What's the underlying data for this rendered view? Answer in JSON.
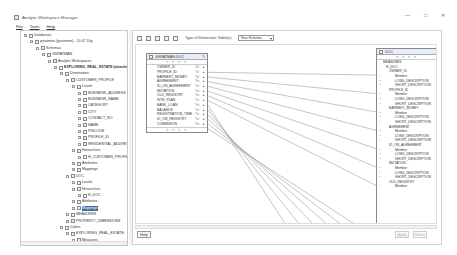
{
  "window": {
    "title": "Analytic Workspace Manager",
    "controls": {
      "minimize": "—",
      "maximize": "□",
      "close": "✕"
    }
  },
  "menu": [
    "File",
    "Tools",
    "Help"
  ],
  "tree": [
    {
      "label": "Databases",
      "indent": 0,
      "icon": "folder-icon"
    },
    {
      "label": "gsratman (gsratman) - 10.47 10g",
      "indent": 1,
      "icon": "database-icon"
    },
    {
      "label": "Schemas",
      "indent": 2,
      "icon": "folder-icon"
    },
    {
      "label": "GSRATMAN",
      "indent": 3,
      "icon": "user-icon"
    },
    {
      "label": "Analytic Workspaces",
      "indent": 4,
      "icon": "folder-icon"
    },
    {
      "label": "EXPLORING_REAL_ESTATE (attached)",
      "indent": 5,
      "icon": "workspace-icon",
      "bold": true
    },
    {
      "label": "Dimensions",
      "indent": 6,
      "icon": "folder-icon"
    },
    {
      "label": "CUSTOMER_PROFILE",
      "indent": 7,
      "icon": "dimension-icon"
    },
    {
      "label": "Levels",
      "indent": 8,
      "icon": "folder-icon"
    },
    {
      "label": "BUSINESS_ADDRESS",
      "indent": 9,
      "icon": "level-icon"
    },
    {
      "label": "BUSINESS_NAME",
      "indent": 9,
      "icon": "level-icon"
    },
    {
      "label": "CATEGORY",
      "indent": 9,
      "icon": "level-icon"
    },
    {
      "label": "CITY",
      "indent": 9,
      "icon": "level-icon"
    },
    {
      "label": "CONTACT_NO",
      "indent": 9,
      "icon": "level-icon"
    },
    {
      "label": "NAME",
      "indent": 9,
      "icon": "level-icon"
    },
    {
      "label": "PINCODE",
      "indent": 9,
      "icon": "level-icon"
    },
    {
      "label": "PROFILE_ID",
      "indent": 9,
      "icon": "level-icon"
    },
    {
      "label": "RESIDENTIAL_ADDRESS",
      "indent": 9,
      "icon": "level-icon"
    },
    {
      "label": "Hierarchies",
      "indent": 8,
      "icon": "folder-icon"
    },
    {
      "label": "H_CUSTOMER_PROFILE",
      "indent": 9,
      "icon": "hierarchy-icon"
    },
    {
      "label": "Attributes",
      "indent": 8,
      "icon": "folder-icon"
    },
    {
      "label": "Mappings",
      "indent": 8,
      "icon": "mapping-icon"
    },
    {
      "label": "DOC",
      "indent": 7,
      "icon": "dimension-icon"
    },
    {
      "label": "Levels",
      "indent": 8,
      "icon": "folder-icon"
    },
    {
      "label": "Hierarchies",
      "indent": 8,
      "icon": "folder-icon"
    },
    {
      "label": "H_DOC",
      "indent": 9,
      "icon": "hierarchy-icon"
    },
    {
      "label": "Attributes",
      "indent": 8,
      "icon": "folder-icon"
    },
    {
      "label": "Mappings",
      "indent": 8,
      "icon": "mapping-icon",
      "selected": true
    },
    {
      "label": "MEASURES",
      "indent": 7,
      "icon": "dimension-icon"
    },
    {
      "label": "PROPERTY_DIMENSIONS",
      "indent": 7,
      "icon": "dimension-icon"
    },
    {
      "label": "Cubes",
      "indent": 6,
      "icon": "folder-icon"
    },
    {
      "label": "EXPLORING_REAL_ESTATE",
      "indent": 7,
      "icon": "cube-icon"
    },
    {
      "label": "Measures",
      "indent": 8,
      "icon": "folder-icon"
    }
  ],
  "toolbar": {
    "type_label": "Type of Dimension Table(s):",
    "type_value": "Star Schema"
  },
  "source_table": {
    "name": "GSRATMAN.DOC",
    "tools": "≡ ≡ ≡ ≡",
    "columns": [
      {
        "name": "OWNER_ID",
        "type": "Txt"
      },
      {
        "name": "PROFILE_ID",
        "type": "Txt"
      },
      {
        "name": "EARNEST_MONEY",
        "type": "Txt"
      },
      {
        "name": "AGREEMENT",
        "type": "Txt"
      },
      {
        "name": "ID_ON_AGREEMENT",
        "type": "Txt"
      },
      {
        "name": "MUTATION",
        "type": "Txt"
      },
      {
        "name": "OLD_REGISTRY",
        "type": "Txt"
      },
      {
        "name": "SITE_PLAN",
        "type": "Txt"
      },
      {
        "name": "BANK_LOAN",
        "type": "Txt"
      },
      {
        "name": "BALANCE",
        "type": "Txt"
      },
      {
        "name": "REGISTRATION_TIME",
        "type": "Txt"
      },
      {
        "name": "ID_ON_REGISTRY",
        "type": "Txt"
      },
      {
        "name": "COMMISION",
        "type": "Txt"
      }
    ]
  },
  "target": {
    "name": "DOC",
    "tools": "≡ ≡ ≡ ≡",
    "rows": [
      {
        "label": "MEASURES",
        "indent": 1,
        "mk": ""
      },
      {
        "label": "H_DOC",
        "indent": 2,
        "mk": ""
      },
      {
        "label": "OWNER_ID",
        "indent": 3,
        "mk": ""
      },
      {
        "label": "Member",
        "indent": 5,
        "mk": "•"
      },
      {
        "label": "LONG_DESCRIPTION",
        "indent": 5,
        "mk": "•"
      },
      {
        "label": "SHORT_DESCRIPTION",
        "indent": 5,
        "mk": "•"
      },
      {
        "label": "PROFILE_ID",
        "indent": 3,
        "mk": ""
      },
      {
        "label": "Member",
        "indent": 5,
        "mk": "•"
      },
      {
        "label": "LONG_DESCRIPTION",
        "indent": 5,
        "mk": "•"
      },
      {
        "label": "SHORT_DESCRIPTION",
        "indent": 5,
        "mk": "•"
      },
      {
        "label": "EARNEST_MONEY",
        "indent": 3,
        "mk": ""
      },
      {
        "label": "Member",
        "indent": 5,
        "mk": "•"
      },
      {
        "label": "LONG_DESCRIPTION",
        "indent": 5,
        "mk": "•"
      },
      {
        "label": "SHORT_DESCRIPTION",
        "indent": 5,
        "mk": "•"
      },
      {
        "label": "AGREEMENT",
        "indent": 3,
        "mk": ""
      },
      {
        "label": "Member",
        "indent": 5,
        "mk": "•"
      },
      {
        "label": "LONG_DESCRIPTION",
        "indent": 5,
        "mk": "•"
      },
      {
        "label": "SHORT_DESCRIPTION",
        "indent": 5,
        "mk": "•"
      },
      {
        "label": "ID_ON_AGREEMENT",
        "indent": 3,
        "mk": ""
      },
      {
        "label": "Member",
        "indent": 5,
        "mk": "•"
      },
      {
        "label": "LONG_DESCRIPTION",
        "indent": 5,
        "mk": "•"
      },
      {
        "label": "SHORT_DESCRIPTION",
        "indent": 5,
        "mk": "•"
      },
      {
        "label": "MUTATION",
        "indent": 3,
        "mk": ""
      },
      {
        "label": "Member",
        "indent": 5,
        "mk": "•"
      },
      {
        "label": "LONG_DESCRIPTION",
        "indent": 5,
        "mk": "•"
      },
      {
        "label": "SHORT_DESCRIPTION",
        "indent": 5,
        "mk": "•"
      },
      {
        "label": "OLD_REGISTRY",
        "indent": 3,
        "mk": ""
      },
      {
        "label": "Member",
        "indent": 5,
        "mk": "•"
      }
    ]
  },
  "buttons": {
    "help": "Help",
    "apply": "Apply",
    "revert": "Revert"
  }
}
